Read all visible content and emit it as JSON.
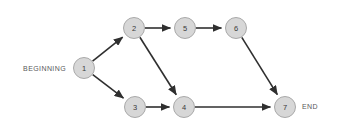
{
  "diagram": {
    "type": "network-precedence-diagram",
    "title": "",
    "background_color": "#ffffff",
    "node_fill_color": "#d7d7d7",
    "node_stroke_color": "#a9a9a9",
    "edge_color": "#2f2f2f",
    "label_color": "#58585a",
    "node_label_color": "#3a3a3a",
    "node_radius": 10.5,
    "nodes": [
      {
        "id": "1",
        "label": "1",
        "x": 84,
        "y": 68
      },
      {
        "id": "2",
        "label": "2",
        "x": 134,
        "y": 28
      },
      {
        "id": "3",
        "label": "3",
        "x": 135,
        "y": 107
      },
      {
        "id": "4",
        "label": "4",
        "x": 184,
        "y": 107
      },
      {
        "id": "5",
        "label": "5",
        "x": 185,
        "y": 28
      },
      {
        "id": "6",
        "label": "6",
        "x": 236,
        "y": 28
      },
      {
        "id": "7",
        "label": "7",
        "x": 285,
        "y": 107
      }
    ],
    "edges": [
      {
        "from": "1",
        "to": "2",
        "arrow": true
      },
      {
        "from": "1",
        "to": "3",
        "arrow": true
      },
      {
        "from": "2",
        "to": "5",
        "arrow": true
      },
      {
        "from": "2",
        "to": "4",
        "arrow": true
      },
      {
        "from": "5",
        "to": "6",
        "arrow": true
      },
      {
        "from": "6",
        "to": "7",
        "arrow": true
      },
      {
        "from": "3",
        "to": "4",
        "arrow": true
      },
      {
        "from": "4",
        "to": "7",
        "arrow": true
      }
    ],
    "annotations": [
      {
        "id": "beginning",
        "text": "BEGINNING",
        "x": 66,
        "y": 68,
        "align": "end"
      },
      {
        "id": "end",
        "text": "END",
        "x": 302,
        "y": 106,
        "align": "start"
      }
    ]
  }
}
